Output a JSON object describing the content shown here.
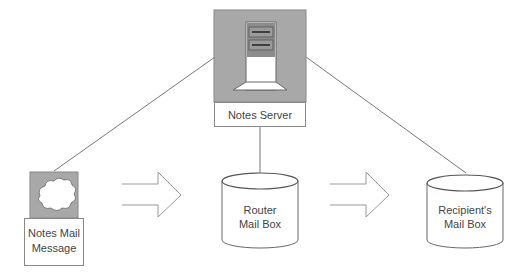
{
  "diagram": {
    "nodes": {
      "server": {
        "label": "Notes Server",
        "icon": "server-tower-icon"
      },
      "message": {
        "label_line1": "Notes Mail",
        "label_line2": "Message",
        "icon": "cloud-message-icon"
      },
      "router": {
        "label_line1": "Router",
        "label_line2": "Mail Box",
        "icon": "database-cylinder-icon"
      },
      "recipient": {
        "label_line1": "Recipient's",
        "label_line2": "Mail Box",
        "icon": "database-cylinder-icon"
      }
    },
    "edges": [
      {
        "from": "message",
        "to": "server",
        "style": "line"
      },
      {
        "from": "server",
        "to": "router",
        "style": "line"
      },
      {
        "from": "server",
        "to": "recipient",
        "style": "line"
      },
      {
        "from": "message",
        "to": "router",
        "style": "hollow-arrow"
      },
      {
        "from": "router",
        "to": "recipient",
        "style": "hollow-arrow"
      }
    ],
    "colors": {
      "icon_bg": "#a8a8a8",
      "stroke": "#707070",
      "tower_dark": "#8c8c8c"
    }
  }
}
